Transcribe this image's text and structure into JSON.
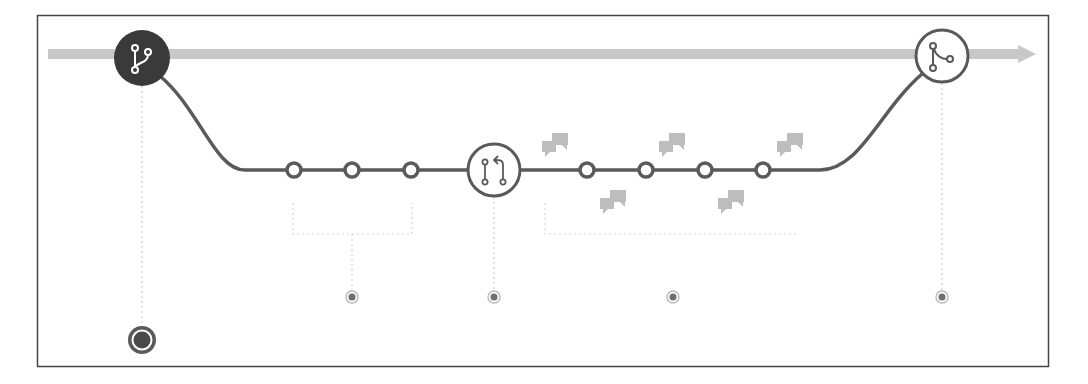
{
  "diagram": {
    "colors": {
      "frame": "#444444",
      "main_line": "#c8c8c8",
      "branch_line": "#5a5a5a",
      "node_fill": "#ffffff",
      "node_stroke": "#5a5a5a",
      "start_node_fill": "#3a3a3a",
      "comment_icon": "#bdbdbd",
      "guide_line": "#cfcfcf",
      "marker_dot": "#6e6e6e"
    },
    "main_branch": {
      "label": "main",
      "y": 54,
      "x_start": 48,
      "x_end": 1035
    },
    "nodes": [
      {
        "id": "create-branch",
        "type": "branch-icon",
        "x": 142,
        "y": 58,
        "r": 27,
        "filled": true
      },
      {
        "id": "commit-1",
        "type": "commit",
        "x": 294,
        "y": 170
      },
      {
        "id": "commit-2",
        "type": "commit",
        "x": 352,
        "y": 170
      },
      {
        "id": "commit-3",
        "type": "commit",
        "x": 411,
        "y": 170
      },
      {
        "id": "pull-request",
        "type": "pull-request-icon",
        "x": 494,
        "y": 170,
        "r": 26
      },
      {
        "id": "commit-4",
        "type": "commit",
        "x": 587,
        "y": 170
      },
      {
        "id": "commit-5",
        "type": "commit",
        "x": 646,
        "y": 170
      },
      {
        "id": "commit-6",
        "type": "commit",
        "x": 705,
        "y": 170
      },
      {
        "id": "commit-7",
        "type": "commit",
        "x": 763,
        "y": 170
      },
      {
        "id": "merge",
        "type": "merge-icon",
        "x": 942,
        "y": 56,
        "r": 26
      }
    ],
    "comments": [
      {
        "x": 556,
        "y": 145
      },
      {
        "x": 614,
        "y": 202
      },
      {
        "x": 673,
        "y": 145
      },
      {
        "x": 732,
        "y": 202
      },
      {
        "x": 790,
        "y": 145
      }
    ],
    "brackets": [
      {
        "x1": 293,
        "x2": 412,
        "y1": 203,
        "y2": 234,
        "stem_x": 352
      },
      {
        "x1": 545,
        "x2": 798,
        "y1": 203,
        "y2": 234,
        "stem_x": 673
      }
    ],
    "markers": [
      {
        "x": 352,
        "y": 297
      },
      {
        "x": 494,
        "y": 297
      },
      {
        "x": 673,
        "y": 297
      },
      {
        "x": 942,
        "y": 297
      }
    ],
    "end_marker": {
      "x": 142,
      "y": 340
    }
  }
}
